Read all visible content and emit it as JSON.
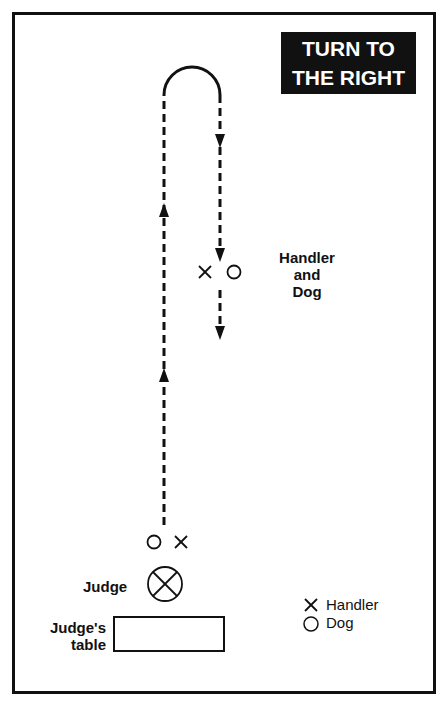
{
  "title": {
    "line1": "TURN TO",
    "line2": "THE RIGHT"
  },
  "labels": {
    "handler_and_dog": [
      "Handler",
      "and",
      "Dog"
    ],
    "judge": "Judge",
    "judges_table": [
      "Judge's",
      "table"
    ]
  },
  "legend": {
    "items": [
      {
        "symbol": "x-icon",
        "label": "Handler"
      },
      {
        "symbol": "circle-icon",
        "label": "Dog"
      }
    ]
  },
  "colors": {
    "ink": "#111111",
    "background": "#ffffff"
  }
}
